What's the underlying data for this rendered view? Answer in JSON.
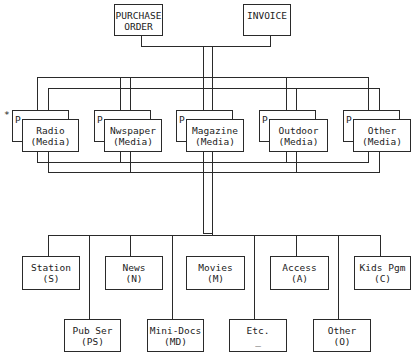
{
  "top_documents": [
    {
      "id": "purchase-order",
      "line1": "PURCHASE",
      "line2": "ORDER"
    },
    {
      "id": "invoice",
      "line1": "INVOICE",
      "line2": ""
    }
  ],
  "media": {
    "marker": "*",
    "back_label": "P",
    "items": [
      {
        "id": "radio",
        "line1": "Radio",
        "line2": "(Media)"
      },
      {
        "id": "newspaper",
        "line1": "Nwspaper",
        "line2": "(Media)"
      },
      {
        "id": "magazine",
        "line1": "Magazine",
        "line2": "(Media)"
      },
      {
        "id": "outdoor",
        "line1": "Outdoor",
        "line2": "(Media)"
      },
      {
        "id": "other-media",
        "line1": "Other",
        "line2": "(Media)"
      }
    ]
  },
  "categories_row1": [
    {
      "id": "station",
      "line1": "Station",
      "line2": "(S)"
    },
    {
      "id": "news",
      "line1": "News",
      "line2": "(N)"
    },
    {
      "id": "movies",
      "line1": "Movies",
      "line2": "(M)"
    },
    {
      "id": "access",
      "line1": "Access",
      "line2": "(A)"
    },
    {
      "id": "kids-pgm",
      "line1": "Kids Pgm",
      "line2": "(C)"
    }
  ],
  "categories_row2": [
    {
      "id": "pub-ser",
      "line1": "Pub Ser",
      "line2": "(PS)"
    },
    {
      "id": "mini-docs",
      "line1": "Mini-Docs",
      "line2": "(MD)"
    },
    {
      "id": "etc",
      "line1": "Etc.",
      "line2": "_"
    },
    {
      "id": "other-category",
      "line1": "Other",
      "line2": "(O)"
    }
  ]
}
